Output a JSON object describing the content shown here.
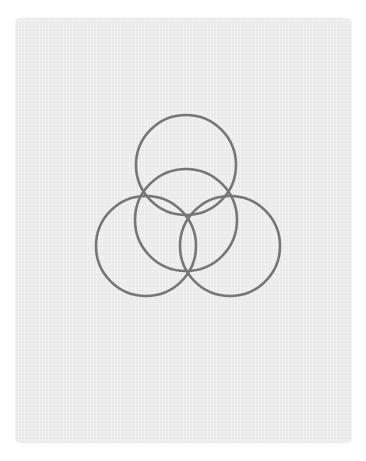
{
  "canvas": {
    "width": 366,
    "height": 461,
    "background": "#ffffff"
  },
  "card": {
    "x": 15,
    "y": 18,
    "width": 337,
    "height": 425,
    "radius": 5,
    "color": "#ececec"
  },
  "stroke": {
    "color": "#767676",
    "width": 2.6
  },
  "circles": [
    {
      "name": "top-circle",
      "cx": 186,
      "cy": 165,
      "r": 50
    },
    {
      "name": "middle-circle",
      "cx": 186,
      "cy": 220,
      "r": 51
    },
    {
      "name": "left-circle",
      "cx": 146,
      "cy": 246,
      "r": 50
    },
    {
      "name": "right-circle",
      "cx": 230,
      "cy": 246,
      "r": 50
    }
  ]
}
